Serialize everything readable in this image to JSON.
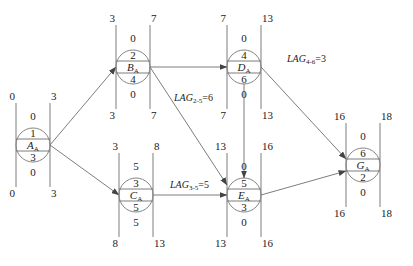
{
  "diagram": {
    "type": "single-code network (precedence) diagram with time parameters",
    "colors": {
      "line": "#6e6e6e",
      "circle": "#777777",
      "text": "#222222"
    }
  },
  "nodes": [
    {
      "key": "A",
      "id": "1",
      "name": "A",
      "sub": "A",
      "duration": "3",
      "ES": "0",
      "EF": "3",
      "LS": "0",
      "LF": "3",
      "TF": "0",
      "FF": "0",
      "cx": 33,
      "cy": 145
    },
    {
      "key": "B",
      "id": "2",
      "name": "B",
      "sub": "A",
      "duration": "4",
      "ES": "3",
      "EF": "7",
      "LS": "3",
      "LF": "7",
      "TF": "0",
      "FF": "0",
      "cx": 133,
      "cy": 67
    },
    {
      "key": "C",
      "id": "3",
      "name": "C",
      "sub": "A",
      "duration": "5",
      "ES": "3",
      "EF": "8",
      "LS": "8",
      "LF": "13",
      "TF": "5",
      "FF": "5",
      "cx": 136,
      "cy": 195
    },
    {
      "key": "D",
      "id": "4",
      "name": "D",
      "sub": "A",
      "duration": "6",
      "ES": "7",
      "EF": "13",
      "LS": "7",
      "LF": "13",
      "TF": "0",
      "FF": "0",
      "cx": 244,
      "cy": 67
    },
    {
      "key": "E",
      "id": "5",
      "name": "E",
      "sub": "A",
      "duration": "3",
      "ES": "13",
      "EF": "16",
      "LS": "13",
      "LF": "16",
      "TF": "0",
      "FF": "0",
      "cx": 244,
      "cy": 195
    },
    {
      "key": "G",
      "id": "6",
      "name": "G",
      "sub": "A",
      "duration": "2",
      "ES": "16",
      "EF": "18",
      "LS": "16",
      "LF": "18",
      "TF": "0",
      "FF": "0",
      "cx": 363,
      "cy": 165
    }
  ],
  "edges": [
    {
      "from": "A",
      "to": "B"
    },
    {
      "from": "A",
      "to": "C"
    },
    {
      "from": "B",
      "to": "D"
    },
    {
      "from": "B",
      "to": "E"
    },
    {
      "from": "C",
      "to": "E"
    },
    {
      "from": "D",
      "to": "E"
    },
    {
      "from": "D",
      "to": "G"
    },
    {
      "from": "E",
      "to": "G"
    }
  ],
  "lags": [
    {
      "label": "LAG",
      "sub": "2-5",
      "value": "=6",
      "x": 174,
      "y": 101
    },
    {
      "label": "LAG",
      "sub": "3-5",
      "value": "=5",
      "x": 170,
      "y": 188
    },
    {
      "label": "LAG",
      "sub": "4-6",
      "value": "=3",
      "x": 287,
      "y": 62
    }
  ]
}
